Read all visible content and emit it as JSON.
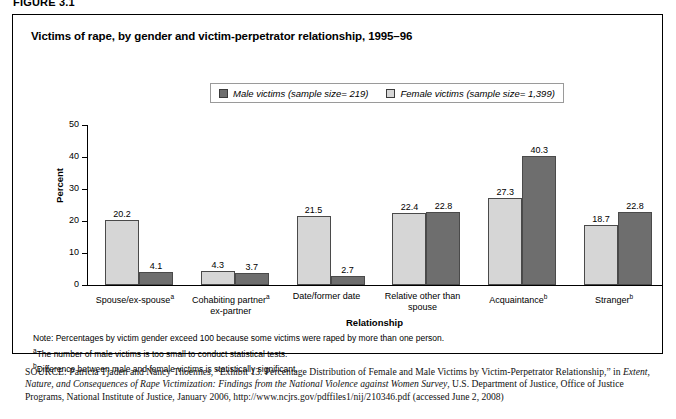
{
  "figure_label": "FIGURE 3.1",
  "chart": {
    "title": "Victims of rape, by gender and victim-perpetrator relationship, 1995–96",
    "legend": [
      {
        "label": "Male victims (sample size= 219)",
        "swatch": "male-swatch",
        "color": "#6e6e6e"
      },
      {
        "label": "Female victims (sample size= 1,399)",
        "swatch": "female-swatch",
        "color": "#d6d6d6"
      }
    ]
  },
  "chart_data": {
    "type": "bar",
    "title": "Victims of rape, by gender and victim-perpetrator relationship, 1995–96",
    "xlabel": "Relationship",
    "ylabel": "Percent",
    "ylim": [
      0,
      50
    ],
    "yticks": [
      0,
      10,
      20,
      30,
      40,
      50
    ],
    "grid": false,
    "legend_position": "top-center",
    "categories": [
      "Spouse/ex-spouseᵃ",
      "Cohabiting partner\nex-partnerᵃ",
      "Date/former date",
      "Relative other than\nspouse",
      "Acquaintanceᵇ",
      "Strangerᵇ"
    ],
    "series": [
      {
        "name": "Female victims (sample size= 1,399)",
        "color": "#d6d6d6",
        "values": [
          20.2,
          4.3,
          21.5,
          22.4,
          27.3,
          18.7
        ]
      },
      {
        "name": "Male victims (sample size= 219)",
        "color": "#6e6e6e",
        "values": [
          4.1,
          3.7,
          2.7,
          22.8,
          40.3,
          22.8
        ]
      }
    ]
  },
  "categories_display": [
    {
      "line1": "Spouse/ex-spouse",
      "sup": "a",
      "line2": ""
    },
    {
      "line1": "Cohabiting partner",
      "sup": "a",
      "line2": "ex-partner"
    },
    {
      "line1": "Date/former date",
      "sup": "",
      "line2": ""
    },
    {
      "line1": "Relative other than",
      "sup": "",
      "line2": "spouse"
    },
    {
      "line1": "Acquaintance",
      "sup": "b",
      "line2": ""
    },
    {
      "line1": "Stranger",
      "sup": "b",
      "line2": ""
    }
  ],
  "notes": {
    "note": "Note: Percentages by victim gender exceed 100 because some victims were raped by more than one person.",
    "footnote_a_marker": "a",
    "footnote_a": "The number of male victims is too small to conduct statistical tests.",
    "footnote_b_marker": "b",
    "footnote_b": "Difference between male and female victims is statistically significant."
  },
  "source": {
    "label": "SOURCE:",
    "part1": " Patricia Tjaden and Nancy Thoennes, “Exhibit 13. Percentage Distribution of Female and Male Victims by Victim-Perpetrator Relationship,” in ",
    "italic": "Extent, Nature, and Consequences of Rape Victimization: Findings from the National Violence against Women Survey",
    "part2": ", U.S. Department of Justice, Office of Justice Programs, National Institute of Justice, January 2006, http://www.ncjrs.gov/pdffiles1/nij/210346.pdf (accessed June 2, 2008)"
  }
}
